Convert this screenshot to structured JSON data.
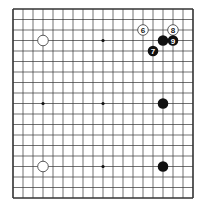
{
  "diagram": {
    "type": "go-board",
    "size": 19,
    "colors": {
      "background": "#ffffff",
      "line": "#333333",
      "black_stone": "#111111",
      "white_stone": "#ffffff",
      "white_outline": "#333333"
    },
    "star_points": [
      [
        3,
        9
      ],
      [
        9,
        3
      ],
      [
        9,
        9
      ],
      [
        9,
        15
      ]
    ],
    "stones": [
      {
        "color": "white",
        "col": 3,
        "row": 3,
        "label": ""
      },
      {
        "color": "white",
        "col": 3,
        "row": 15,
        "label": ""
      },
      {
        "color": "black",
        "col": 15,
        "row": 3,
        "label": ""
      },
      {
        "color": "black",
        "col": 15,
        "row": 9,
        "label": ""
      },
      {
        "color": "black",
        "col": 15,
        "row": 15,
        "label": ""
      },
      {
        "color": "white",
        "col": 13,
        "row": 2,
        "label": "6"
      },
      {
        "color": "black",
        "col": 14,
        "row": 4,
        "label": "7"
      },
      {
        "color": "white",
        "col": 16,
        "row": 2,
        "label": "8"
      },
      {
        "color": "black",
        "col": 16,
        "row": 3,
        "label": "9"
      }
    ]
  }
}
